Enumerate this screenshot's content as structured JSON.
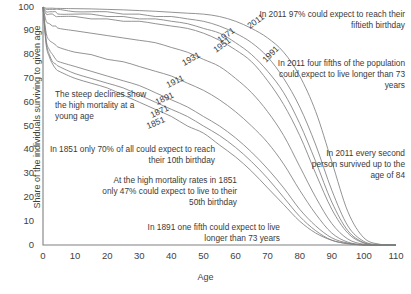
{
  "chart_data": {
    "type": "line",
    "title": "",
    "xlabel": "Age",
    "ylabel": "Share of the individuals surviving to given age",
    "xlim": [
      0,
      110
    ],
    "ylim": [
      0,
      100
    ],
    "xticks": [
      "0",
      "10",
      "20",
      "30",
      "40",
      "50",
      "60",
      "70",
      "80",
      "90",
      "100",
      "110"
    ],
    "yticks": [
      "0",
      "10",
      "20",
      "30",
      "40",
      "50",
      "60",
      "70",
      "80",
      "90",
      "100"
    ],
    "grid": false,
    "legend_position": "inline-curve-labels",
    "x": [
      0,
      1,
      2,
      3,
      4,
      5,
      10,
      15,
      20,
      25,
      30,
      35,
      40,
      45,
      50,
      55,
      60,
      65,
      70,
      75,
      80,
      85,
      90,
      95,
      100,
      105,
      110
    ],
    "series": [
      {
        "name": "1851",
        "values": [
          100,
          84,
          79,
          76,
          74,
          73,
          70,
          68,
          66,
          63,
          60,
          57,
          54,
          50,
          47,
          42,
          37,
          31,
          24,
          17,
          10,
          5,
          2,
          0.5,
          0,
          0,
          0
        ]
      },
      {
        "name": "1871",
        "values": [
          100,
          85,
          80,
          77,
          76,
          75,
          72,
          70,
          68,
          66,
          63,
          60,
          57,
          54,
          50,
          46,
          41,
          35,
          28,
          20,
          12,
          6,
          2,
          0.6,
          0,
          0,
          0
        ]
      },
      {
        "name": "1891",
        "values": [
          100,
          86,
          82,
          80,
          78,
          77,
          75,
          73,
          71,
          69,
          67,
          64,
          61,
          58,
          54,
          50,
          45,
          39,
          32,
          24,
          15,
          8,
          3,
          0.8,
          0,
          0,
          0
        ]
      },
      {
        "name": "1911",
        "values": [
          100,
          89,
          86,
          85,
          84,
          83,
          81,
          80,
          78,
          77,
          75,
          73,
          71,
          68,
          65,
          61,
          56,
          50,
          43,
          34,
          23,
          13,
          5,
          1.2,
          0.1,
          0,
          0
        ]
      },
      {
        "name": "1931",
        "values": [
          100,
          94,
          93,
          92,
          92,
          91,
          90,
          89,
          88,
          87,
          86,
          85,
          83,
          81,
          78,
          75,
          70,
          64,
          56,
          46,
          33,
          20,
          9,
          2.5,
          0.3,
          0,
          0
        ]
      },
      {
        "name": "1951",
        "values": [
          100,
          97,
          97,
          97,
          96,
          96,
          96,
          95,
          95,
          94,
          94,
          93,
          92,
          91,
          89,
          86,
          82,
          77,
          69,
          59,
          46,
          30,
          15,
          5,
          0.8,
          0,
          0
        ]
      },
      {
        "name": "1971",
        "values": [
          100,
          98,
          98,
          98,
          98,
          97,
          97,
          97,
          96,
          96,
          95,
          95,
          94,
          93,
          91,
          89,
          85,
          80,
          73,
          64,
          51,
          35,
          18,
          6,
          1,
          0,
          0
        ]
      },
      {
        "name": "1991",
        "values": [
          100,
          99,
          99,
          99,
          99,
          99,
          98,
          98,
          98,
          97,
          97,
          96,
          96,
          95,
          94,
          92,
          89,
          85,
          79,
          70,
          58,
          42,
          23,
          8,
          1.5,
          0.1,
          0
        ]
      },
      {
        "name": "2011",
        "values": [
          100,
          99.5,
          99.5,
          99.5,
          99.4,
          99.4,
          99.3,
          99.2,
          99,
          98.8,
          98.5,
          98.2,
          97.8,
          97.4,
          97,
          96,
          94,
          91,
          87,
          81,
          71,
          56,
          35,
          14,
          3,
          0.3,
          0
        ]
      }
    ],
    "curve_labels": [
      {
        "year": "2011",
        "x": 250,
        "y": 29,
        "rotate": -36
      },
      {
        "year": "1971",
        "x": 220,
        "y": 43,
        "rotate": -36
      },
      {
        "year": "1951",
        "x": 216,
        "y": 53,
        "rotate": -36
      },
      {
        "year": "1991",
        "x": 266,
        "y": 63,
        "rotate": -46
      },
      {
        "year": "1931",
        "x": 184,
        "y": 66,
        "rotate": -29
      },
      {
        "year": "1911",
        "x": 168,
        "y": 88,
        "rotate": -26
      },
      {
        "year": "1891",
        "x": 157,
        "y": 105,
        "rotate": -25
      },
      {
        "year": "1871",
        "x": 152,
        "y": 118,
        "rotate": -25
      },
      {
        "year": "1851",
        "x": 148,
        "y": 129,
        "rotate": -23
      }
    ],
    "annotations": [
      {
        "name": "steep-declines",
        "text": "The steep declines show the high mortality at a young age",
        "align": "left",
        "x": 55,
        "y": 89,
        "width": 95
      },
      {
        "name": "2011-fiftieth-birthday",
        "text": "In 2011 97% could expect to reach their fiftieth birthday",
        "align": "right",
        "x": 255,
        "y": 9,
        "width": 150
      },
      {
        "name": "2011-four-fifths",
        "text": "In 2011 four fifths of the population could expect to live longer than 73 years",
        "align": "right",
        "x": 275,
        "y": 58,
        "width": 130
      },
      {
        "name": "1851-10th-birthday",
        "text": "In 1851 only 70% of all could expect to reach their 10th birthday",
        "align": "right",
        "x": 45,
        "y": 144,
        "width": 170
      },
      {
        "name": "1851-50th-birthday",
        "text": "At the high mortality rates in 1851 only 47% could expect to live to their 50th birthday",
        "align": "right",
        "x": 100,
        "y": 175,
        "width": 137
      },
      {
        "name": "2011-age-84",
        "text": "In 2011 every second person survived up to the age of 84",
        "align": "right",
        "x": 300,
        "y": 148,
        "width": 105
      },
      {
        "name": "1891-73-years",
        "text": "In 1891 one fifth could expect to live longer than 73 years",
        "align": "right",
        "x": 135,
        "y": 222,
        "width": 145
      }
    ],
    "colors": {
      "curve": "#7f7f7f",
      "axis": "#808080",
      "text": "#3a3a3a",
      "background": "#ffffff"
    }
  }
}
